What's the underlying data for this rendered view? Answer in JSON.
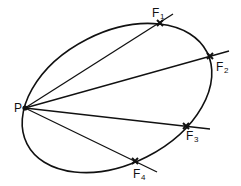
{
  "diagram": {
    "type": "ellipse-chords",
    "stroke_color": "#111111",
    "background": "#ffffff",
    "ellipse": {
      "cx": 117,
      "cy": 98,
      "rx": 101,
      "ry": 66,
      "rotation_deg": -27
    },
    "point_p": {
      "label": "P",
      "x": 25,
      "y": 108,
      "label_x": 14,
      "label_y": 112
    },
    "points": [
      {
        "id": "F1",
        "label": "F",
        "subscript": "1",
        "x": 160,
        "y": 23,
        "line_end_x": 173,
        "line_end_y": 14,
        "label_x": 152,
        "label_y": 17,
        "sub_x": 160,
        "sub_y": 19
      },
      {
        "id": "F2",
        "label": "F",
        "subscript": "2",
        "x": 210,
        "y": 56,
        "line_end_x": 229,
        "line_end_y": 51,
        "label_x": 216,
        "label_y": 71,
        "sub_x": 224,
        "sub_y": 73
      },
      {
        "id": "F3",
        "label": "F",
        "subscript": "3",
        "x": 186,
        "y": 126,
        "line_end_x": 210,
        "line_end_y": 129,
        "label_x": 186,
        "label_y": 140,
        "sub_x": 194,
        "sub_y": 142
      },
      {
        "id": "F4",
        "label": "F",
        "subscript": "4",
        "x": 135,
        "y": 161,
        "line_end_x": 157,
        "line_end_y": 172,
        "label_x": 133,
        "label_y": 178,
        "sub_x": 141,
        "sub_y": 180
      }
    ]
  }
}
